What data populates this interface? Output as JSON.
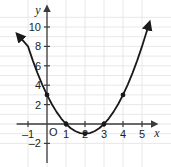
{
  "chart_data": {
    "type": "line",
    "title": "",
    "subtitle": "",
    "xlabel": "x",
    "ylabel": "y",
    "equation": "y = x^2 - 4x + 3",
    "vertex_form": "y = (x - 2)^2 - 1",
    "xlim": [
      -1.6,
      5.9
    ],
    "ylim": [
      -2.9,
      11.2
    ],
    "grid": true,
    "grid_step": 1,
    "legend": "none",
    "origin_label": "O",
    "x_ticks": [
      -1,
      1,
      2,
      3,
      4,
      5
    ],
    "x_tick_labels": [
      "–1",
      "1",
      "2",
      "3",
      "4",
      "5"
    ],
    "y_ticks": [
      -2,
      2,
      4,
      6,
      8,
      10
    ],
    "y_tick_labels": [
      "–2",
      "2",
      "4",
      "6",
      "8",
      "10"
    ],
    "points": [
      {
        "x": 0,
        "y": 3,
        "label": "(0, 3)"
      },
      {
        "x": 1,
        "y": 0,
        "label": "(1, 0)"
      },
      {
        "x": 2,
        "y": -1,
        "label": "(2, -1)"
      },
      {
        "x": 3,
        "y": 0,
        "label": "(3, 0)"
      },
      {
        "x": 4,
        "y": 3,
        "label": "(4, 3)"
      }
    ],
    "curve": {
      "name": "parabola",
      "x_start": -1.25,
      "x_end": 5.25,
      "arrow_start": true,
      "arrow_end": true,
      "values": [
        {
          "x": -1.25,
          "y": 8.5625
        },
        {
          "x": -1.0,
          "y": 8.0
        },
        {
          "x": -0.75,
          "y": 6.5625
        },
        {
          "x": -0.5,
          "y": 5.25
        },
        {
          "x": -0.25,
          "y": 4.0625
        },
        {
          "x": 0.0,
          "y": 3.0
        },
        {
          "x": 0.25,
          "y": 2.0625
        },
        {
          "x": 0.5,
          "y": 1.25
        },
        {
          "x": 0.75,
          "y": 0.5625
        },
        {
          "x": 1.0,
          "y": 0.0
        },
        {
          "x": 1.25,
          "y": -0.4375
        },
        {
          "x": 1.5,
          "y": -0.75
        },
        {
          "x": 1.75,
          "y": -0.9375
        },
        {
          "x": 2.0,
          "y": -1.0
        },
        {
          "x": 2.25,
          "y": -0.9375
        },
        {
          "x": 2.5,
          "y": -0.75
        },
        {
          "x": 2.75,
          "y": -0.4375
        },
        {
          "x": 3.0,
          "y": 0.0
        },
        {
          "x": 3.25,
          "y": 0.5625
        },
        {
          "x": 3.5,
          "y": 1.25
        },
        {
          "x": 3.75,
          "y": 2.0625
        },
        {
          "x": 4.0,
          "y": 3.0
        },
        {
          "x": 4.25,
          "y": 4.0625
        },
        {
          "x": 4.5,
          "y": 5.25
        },
        {
          "x": 4.75,
          "y": 6.5625
        },
        {
          "x": 5.0,
          "y": 8.0
        },
        {
          "x": 5.25,
          "y": 9.5625
        }
      ]
    },
    "colors": {
      "curve": "#1a1a1a",
      "axis": "#3b3b3b",
      "grid": "#e6e6e6",
      "point": "#1a1a1a",
      "text": "#231f20",
      "background": "#ffffff"
    }
  }
}
